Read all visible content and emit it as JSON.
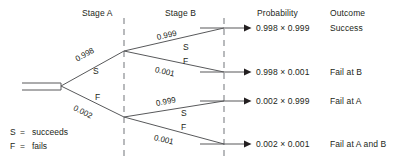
{
  "diagram": {
    "title_columns": [
      {
        "label": "Stage A",
        "x": 82,
        "y": 8
      },
      {
        "label": "Stage B",
        "x": 165,
        "y": 8
      },
      {
        "label": "Probability",
        "x": 257,
        "y": 8
      },
      {
        "label": "Outcome",
        "x": 330,
        "y": 8
      }
    ],
    "root": {
      "x": 22,
      "y": 87,
      "trunk_end_x": 60
    },
    "nodes": {
      "stage_a": {
        "x": 124,
        "y": 51
      },
      "stage_a_lower": {
        "x": 124,
        "y": 117
      }
    },
    "dashed_lines": [
      {
        "x": 124,
        "y1": 18,
        "y2": 158
      },
      {
        "x": 224,
        "y1": 18,
        "y2": 158
      }
    ],
    "branches": [
      {
        "name": "a-success",
        "prob": "0.998",
        "letter": "S",
        "angle": -26
      },
      {
        "name": "a-fail",
        "prob": "0.002",
        "letter": "F",
        "angle": 26
      },
      {
        "name": "b1-success",
        "prob": "0.999",
        "letter": "S",
        "angle": -13
      },
      {
        "name": "b1-fail",
        "prob": "0.001",
        "letter": "F",
        "angle": 13
      },
      {
        "name": "b2-success",
        "prob": "0.999",
        "letter": "S",
        "angle": -13
      },
      {
        "name": "b2-fail",
        "prob": "0.001",
        "letter": "F",
        "angle": 13
      }
    ],
    "outcomes": [
      {
        "probability": "0.998 × 0.999",
        "outcome": "Success",
        "y": 28
      },
      {
        "probability": "0.998 × 0.001",
        "outcome": "Fail at B",
        "y": 72
      },
      {
        "probability": "0.002 × 0.999",
        "outcome": "Fail at A",
        "y": 101
      },
      {
        "probability": "0.002 × 0.001",
        "outcome": "Fail at A and B",
        "y": 144
      }
    ],
    "legend": [
      {
        "symbol": "S",
        "equals": "=",
        "meaning": "succeeds"
      },
      {
        "symbol": "F",
        "equals": "=",
        "meaning": "fails"
      }
    ],
    "colors": {
      "line": "#58595b",
      "dashed": "#a7a9ac",
      "text": "#231f20",
      "background": "#ffffff"
    }
  }
}
